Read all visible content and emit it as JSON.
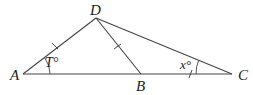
{
  "diagram": {
    "type": "geometry-triangle",
    "points": {
      "A": {
        "label": "A",
        "x": 23,
        "y": 74
      },
      "D": {
        "label": "D",
        "x": 96,
        "y": 18
      },
      "B": {
        "label": "B",
        "x": 141,
        "y": 74
      },
      "C": {
        "label": "C",
        "x": 232,
        "y": 74
      }
    },
    "segments": [
      "AD",
      "DB",
      "DC",
      "AC"
    ],
    "congruent_ticks": [
      "AD",
      "DB",
      "BC"
    ],
    "angles": {
      "A": {
        "label": "T°"
      },
      "C": {
        "label": "x°"
      }
    },
    "colors": {
      "line": "#444444",
      "text": "#222222",
      "background": "#ffffff"
    }
  }
}
